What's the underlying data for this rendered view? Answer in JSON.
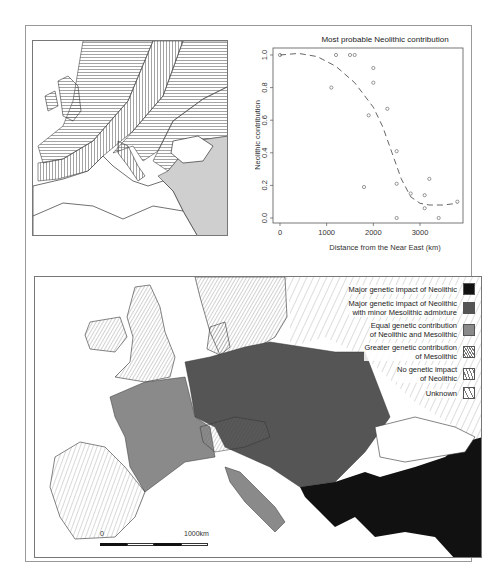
{
  "chart_data": {
    "type": "scatter",
    "title": "Most probable Neolithic contribution",
    "xlabel": "Distance from the Near East (km)",
    "ylabel": "Neolithic contribution",
    "xlim": [
      0,
      3800
    ],
    "ylim": [
      0.0,
      1.0
    ],
    "x_ticks": [
      0,
      1000,
      2000,
      3000
    ],
    "y_ticks": [
      0.0,
      0.2,
      0.4,
      0.6,
      0.8,
      1.0
    ],
    "grid": false,
    "series": [
      {
        "name": "observations",
        "marker": "open-circle",
        "points": [
          [
            0,
            1.0
          ],
          [
            1100,
            0.8
          ],
          [
            1200,
            1.0
          ],
          [
            1500,
            1.0
          ],
          [
            1600,
            1.0
          ],
          [
            1800,
            0.19
          ],
          [
            1900,
            0.63
          ],
          [
            2000,
            0.92
          ],
          [
            2000,
            0.83
          ],
          [
            2300,
            0.67
          ],
          [
            2500,
            0.41
          ],
          [
            2500,
            0.21
          ],
          [
            2500,
            0.0
          ],
          [
            2800,
            0.15
          ],
          [
            3100,
            0.14
          ],
          [
            3100,
            0.06
          ],
          [
            3200,
            0.24
          ],
          [
            3400,
            0.0
          ],
          [
            3800,
            0.1
          ]
        ]
      },
      {
        "name": "fitted curve",
        "style": "dashed",
        "points": [
          [
            0,
            1.0
          ],
          [
            400,
            1.01
          ],
          [
            800,
            0.99
          ],
          [
            1200,
            0.93
          ],
          [
            1600,
            0.83
          ],
          [
            2000,
            0.68
          ],
          [
            2200,
            0.56
          ],
          [
            2400,
            0.4
          ],
          [
            2600,
            0.24
          ],
          [
            2800,
            0.13
          ],
          [
            3000,
            0.09
          ],
          [
            3200,
            0.08
          ],
          [
            3500,
            0.08
          ],
          [
            3800,
            0.09
          ]
        ]
      }
    ]
  },
  "legend": {
    "items": [
      {
        "label_line1": "Major genetic impact of Neolithic",
        "label_line2": "",
        "swatch": "solid",
        "color": "#111111"
      },
      {
        "label_line1": "Major genetic impact of Neolithic",
        "label_line2": "with minor Mesolithic admixture",
        "swatch": "solid",
        "color": "#555555"
      },
      {
        "label_line1": "Equal genetic contribution",
        "label_line2": "of Neolithic and Mesolithic",
        "swatch": "solid",
        "color": "#8a8a8a"
      },
      {
        "label_line1": "Greater genetic contribution",
        "label_line2": "of Mesolithic",
        "swatch": "dense-hatch",
        "color": "#777777"
      },
      {
        "label_line1": "No genetic impact",
        "label_line2": "of Neolithic",
        "swatch": "medium-hatch",
        "color": "#777777"
      },
      {
        "label_line1": "Unknown",
        "label_line2": "",
        "swatch": "sparse-hatch",
        "color": "#777777"
      }
    ]
  },
  "scalebar": {
    "start_label": "0",
    "end_label": "1000km"
  }
}
